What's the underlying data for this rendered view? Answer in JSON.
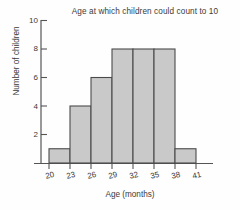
{
  "chart_data": {
    "type": "bar",
    "title": "Age at which children could count to 10",
    "xlabel": "Age (months)",
    "ylabel": "Number of children",
    "subtitle": "",
    "bin_edges": [
      20,
      23,
      26,
      29,
      32,
      35,
      38,
      41
    ],
    "categories": [
      "20-23",
      "23-26",
      "26-29",
      "29-32",
      "32-35",
      "35-38",
      "38-41"
    ],
    "values": [
      1,
      4,
      6,
      8,
      8,
      8,
      1
    ],
    "xtick_labels": [
      "20",
      "23",
      "26",
      "29",
      "32",
      "35",
      "38",
      "41"
    ],
    "ytick_labels": [
      "2",
      "4",
      "6",
      "8",
      "10"
    ],
    "ytick_values": [
      2,
      4,
      6,
      8,
      10
    ],
    "xlim": [
      20,
      41
    ],
    "ylim": [
      0,
      10
    ],
    "grid": false,
    "legend": "none",
    "bar_fill_color": "#c9c9c9",
    "bar_edge_color": "#4a4a4a",
    "axis_color": "#555555",
    "text_color": "#3a3a3a",
    "background_color": "#fefefe"
  }
}
